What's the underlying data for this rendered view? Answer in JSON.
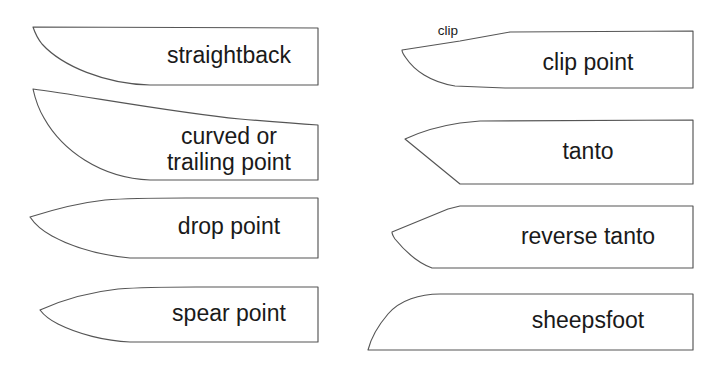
{
  "figure": {
    "background_color": "#ffffff",
    "outline_color": "#555555",
    "text_color": "#1a1a1a",
    "width": 715,
    "height": 376
  },
  "blades": [
    {
      "id": "straightback",
      "label": "straightback",
      "label_lines": [
        "straightback"
      ],
      "column": "left",
      "row": 1
    },
    {
      "id": "curved-trailing-point",
      "label": "curved or trailing point",
      "label_lines": [
        "curved or",
        "trailing point"
      ],
      "column": "left",
      "row": 2
    },
    {
      "id": "drop-point",
      "label": "drop point",
      "label_lines": [
        "drop point"
      ],
      "column": "left",
      "row": 3
    },
    {
      "id": "spear-point",
      "label": "spear point",
      "label_lines": [
        "spear point"
      ],
      "column": "left",
      "row": 4
    },
    {
      "id": "clip-point",
      "label": "clip point",
      "label_lines": [
        "clip point"
      ],
      "column": "right",
      "row": 1,
      "annotation": "clip"
    },
    {
      "id": "tanto",
      "label": "tanto",
      "label_lines": [
        "tanto"
      ],
      "column": "right",
      "row": 2
    },
    {
      "id": "reverse-tanto",
      "label": "reverse tanto",
      "label_lines": [
        "reverse tanto"
      ],
      "column": "right",
      "row": 3
    },
    {
      "id": "sheepsfoot",
      "label": "sheepsfoot",
      "label_lines": [
        "sheepsfoot"
      ],
      "column": "right",
      "row": 4
    }
  ],
  "labels": {
    "straightback": "straightback",
    "curved_line1": "curved or",
    "curved_line2": "trailing point",
    "drop_point": "drop point",
    "spear_point": "spear point",
    "clip_annotation": "clip",
    "clip_point": "clip point",
    "tanto": "tanto",
    "reverse_tanto": "reverse tanto",
    "sheepsfoot": "sheepsfoot"
  }
}
